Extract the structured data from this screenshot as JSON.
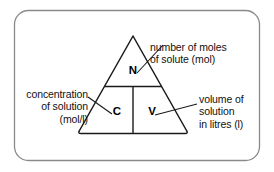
{
  "diagram": {
    "type": "formula-triangle",
    "border": {
      "shape": "rounded-rectangle",
      "stroke_color": "#8a8a8a"
    },
    "triangle": {
      "stroke_color": "#1a1a1a",
      "apex_label": "N",
      "bottom_left_label": "C",
      "bottom_right_label": "V"
    },
    "variables": {
      "n": "N",
      "c": "C",
      "v": "V"
    },
    "labels": {
      "n": {
        "line1": "number of moles",
        "line2": "of solute (mol)"
      },
      "c": {
        "line1": "concentration",
        "line2": "of solution",
        "line3": "(mol/l)"
      },
      "v": {
        "line1": "volume of",
        "line2": "solution",
        "line3": "in litres (l)"
      }
    }
  }
}
